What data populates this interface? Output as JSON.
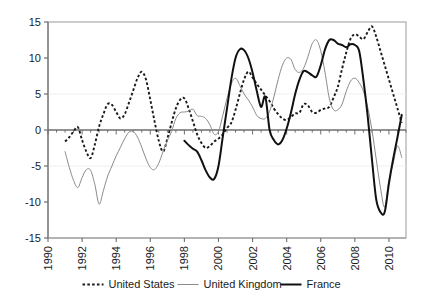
{
  "chart_data": {
    "type": "line",
    "title": "",
    "subtitle": "",
    "xlabel": "",
    "ylabel": "",
    "xlim": [
      1990,
      2011
    ],
    "ylim": [
      -15,
      15
    ],
    "grid": false,
    "legend_position": "bottom",
    "y_ticks": [
      15,
      10,
      5,
      0,
      -5,
      -10,
      -15
    ],
    "y_tick_labels": [
      "15",
      "10",
      "5",
      "0",
      "-5",
      "-10",
      "-15"
    ],
    "x_ticks": [
      1990,
      1992,
      1994,
      1996,
      1998,
      2000,
      2002,
      2004,
      2006,
      2008,
      2010
    ],
    "x_tick_labels": [
      "1990",
      "1992",
      "1994",
      "1996",
      "1998",
      "2000",
      "2002",
      "2004",
      "2006",
      "2008",
      "2010"
    ],
    "x_minor_tick_step": 0.5,
    "series": [
      {
        "name": "United States",
        "style": "dotted",
        "color": "#1a1a1a",
        "width": 1.9,
        "x": [
          1991.0,
          1991.25,
          1991.5,
          1991.75,
          1992.0,
          1992.25,
          1992.5,
          1992.75,
          1993.0,
          1993.25,
          1993.5,
          1993.75,
          1994.0,
          1994.25,
          1994.5,
          1994.75,
          1995.0,
          1995.25,
          1995.5,
          1995.75,
          1996.0,
          1996.25,
          1996.5,
          1996.75,
          1997.0,
          1997.25,
          1997.5,
          1997.75,
          1998.0,
          1998.25,
          1998.5,
          1998.75,
          1999.0,
          1999.25,
          1999.5,
          1999.75,
          2000.0,
          2000.25,
          2000.5,
          2000.75,
          2001.0,
          2001.25,
          2001.5,
          2001.75,
          2002.0,
          2002.25,
          2002.5,
          2002.75,
          2003.0,
          2003.25,
          2003.5,
          2003.75,
          2004.0,
          2004.25,
          2004.5,
          2004.75,
          2005.0,
          2005.25,
          2005.5,
          2005.75,
          2006.0,
          2006.25,
          2006.5,
          2006.75,
          2007.0,
          2007.25,
          2007.5,
          2007.75,
          2008.0,
          2008.25,
          2008.5,
          2008.75,
          2009.0,
          2009.25,
          2009.5,
          2009.75,
          2010.0,
          2010.25,
          2010.5,
          2010.75
        ],
        "y": [
          -1.6,
          -1.0,
          -0.2,
          0.4,
          -1.4,
          -3.0,
          -3.9,
          -2.0,
          0.5,
          2.2,
          3.6,
          3.5,
          2.5,
          1.6,
          2.2,
          3.8,
          5.5,
          7.2,
          8.1,
          7.0,
          4.2,
          1.2,
          -1.5,
          -3.0,
          -1.2,
          1.0,
          3.0,
          4.2,
          4.4,
          3.0,
          1.2,
          -0.6,
          -1.8,
          -2.5,
          -2.2,
          -1.6,
          -1.2,
          -0.6,
          0.3,
          1.0,
          2.8,
          5.0,
          7.0,
          8.1,
          7.3,
          6.4,
          5.6,
          4.8,
          4.0,
          3.0,
          2.2,
          1.6,
          1.4,
          1.8,
          2.3,
          2.4,
          3.6,
          3.4,
          2.5,
          2.4,
          2.8,
          3.0,
          3.2,
          4.5,
          6.0,
          8.5,
          10.8,
          12.7,
          13.3,
          13.0,
          12.6,
          13.6,
          14.4,
          13.0,
          11.0,
          9.0,
          7.0,
          5.0,
          3.0,
          1.0
        ]
      },
      {
        "name": "United Kingdom",
        "style": "solid",
        "color": "#8a8a8a",
        "width": 1.0,
        "x": [
          1991.0,
          1991.25,
          1991.5,
          1991.75,
          1992.0,
          1992.25,
          1992.5,
          1992.75,
          1993.0,
          1993.25,
          1993.5,
          1993.75,
          1994.0,
          1994.25,
          1994.5,
          1994.75,
          1995.0,
          1995.25,
          1995.5,
          1995.75,
          1996.0,
          1996.25,
          1996.5,
          1996.75,
          1997.0,
          1997.25,
          1997.5,
          1997.75,
          1998.0,
          1998.25,
          1998.5,
          1998.75,
          1999.0,
          1999.25,
          1999.5,
          1999.75,
          2000.0,
          2000.25,
          2000.5,
          2000.75,
          2001.0,
          2001.25,
          2001.5,
          2001.75,
          2002.0,
          2002.25,
          2002.5,
          2002.75,
          2003.0,
          2003.25,
          2003.5,
          2003.75,
          2004.0,
          2004.25,
          2004.5,
          2004.75,
          2005.0,
          2005.25,
          2005.5,
          2005.75,
          2006.0,
          2006.25,
          2006.5,
          2006.75,
          2007.0,
          2007.25,
          2007.5,
          2007.75,
          2008.0,
          2008.25,
          2008.5,
          2008.75,
          2009.0,
          2009.25,
          2009.5,
          2009.75,
          2010.0,
          2010.25,
          2010.5,
          2010.75
        ],
        "y": [
          -3.0,
          -5.2,
          -7.0,
          -8.0,
          -6.6,
          -5.5,
          -5.6,
          -7.6,
          -10.3,
          -8.4,
          -6.4,
          -5.0,
          -3.6,
          -2.4,
          -1.2,
          -0.3,
          -0.2,
          -1.0,
          -2.4,
          -4.0,
          -5.2,
          -5.5,
          -4.6,
          -3.0,
          -1.5,
          -0.2,
          1.6,
          2.4,
          2.5,
          2.6,
          2.9,
          2.0,
          1.9,
          1.6,
          0.7,
          -0.6,
          -0.2,
          2.0,
          4.4,
          6.4,
          7.2,
          6.2,
          5.0,
          4.2,
          3.2,
          2.0,
          1.6,
          1.6,
          2.6,
          4.6,
          7.0,
          9.0,
          10.0,
          9.8,
          8.4,
          8.0,
          8.6,
          10.2,
          12.0,
          12.5,
          11.0,
          8.0,
          4.4,
          2.8,
          2.8,
          3.6,
          5.4,
          6.8,
          7.2,
          6.6,
          5.4,
          3.2,
          0.0,
          -4.0,
          -8.0,
          -10.7,
          -7.0,
          -4.6,
          -2.2,
          -3.8
        ]
      },
      {
        "name": "France",
        "style": "solid",
        "color": "#111111",
        "width": 2.0,
        "x": [
          1998.0,
          1998.25,
          1998.5,
          1998.75,
          1999.0,
          1999.25,
          1999.5,
          1999.75,
          2000.0,
          2000.25,
          2000.5,
          2000.75,
          2001.0,
          2001.25,
          2001.5,
          2001.75,
          2002.0,
          2002.25,
          2002.5,
          2002.75,
          2003.0,
          2003.25,
          2003.5,
          2003.75,
          2004.0,
          2004.25,
          2004.5,
          2004.75,
          2005.0,
          2005.25,
          2005.5,
          2005.75,
          2006.0,
          2006.25,
          2006.5,
          2006.75,
          2007.0,
          2007.25,
          2007.5,
          2007.75,
          2008.0,
          2008.25,
          2008.5,
          2008.75,
          2009.0,
          2009.25,
          2009.5,
          2009.75,
          2010.0,
          2010.25,
          2010.5,
          2010.75
        ],
        "y": [
          -1.5,
          -2.1,
          -2.6,
          -3.0,
          -4.2,
          -5.6,
          -6.6,
          -6.8,
          -5.0,
          -1.0,
          3.0,
          7.0,
          10.0,
          11.2,
          11.1,
          10.0,
          8.0,
          5.4,
          3.2,
          4.6,
          0.0,
          -1.4,
          -2.0,
          -1.4,
          0.2,
          2.4,
          5.0,
          7.0,
          8.2,
          8.0,
          7.6,
          7.4,
          9.0,
          11.2,
          12.5,
          12.5,
          12.0,
          11.8,
          11.5,
          11.9,
          11.8,
          11.0,
          7.0,
          2.0,
          -4.0,
          -9.6,
          -11.4,
          -11.4,
          -7.4,
          -4.0,
          -1.0,
          2.1
        ]
      }
    ]
  },
  "legend": {
    "items": [
      {
        "label": "United States",
        "marker": "dotted-line"
      },
      {
        "label": "United Kingdom",
        "marker": "solid-gray-line"
      },
      {
        "label": "France",
        "marker": "solid-black-line"
      }
    ]
  },
  "colors": {
    "us": "#1a1a1a",
    "uk": "#8a8a8a",
    "france": "#111111",
    "axis": "#6e6e6e",
    "frame": "#9a9a9a",
    "text": "#1a1a1a",
    "background": "#ffffff"
  }
}
